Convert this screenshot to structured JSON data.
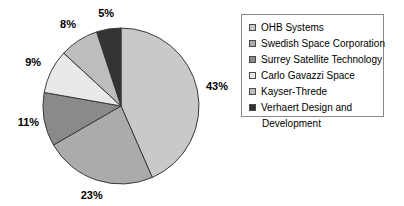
{
  "chart_data": {
    "type": "pie",
    "title": "",
    "xlabel": "",
    "ylabel": "",
    "legend_position": "right",
    "grid": false,
    "start_angle_deg": 0,
    "direction": "clockwise",
    "categories": [
      "OHB Systems",
      "Swedish Space Corporation",
      "Surrey Satellite Technology",
      "Carlo Gavazzi Space",
      "Kayser-Threde",
      "Verhaert Design and Development"
    ],
    "values": [
      43,
      23,
      11,
      9,
      8,
      5
    ],
    "labels": [
      "43%",
      "23%",
      "11%",
      "9%",
      "8%",
      "5%"
    ],
    "colors": [
      "#c9c9c9",
      "#ababab",
      "#8a8a8a",
      "#e9e9e9",
      "#bdbdbd",
      "#333333"
    ],
    "slice_edge_color": "#3a3a3a"
  },
  "pie": {
    "slices": [
      {
        "name": "OHB Systems",
        "value": 43,
        "label": "43%",
        "color": "#c9c9c9"
      },
      {
        "name": "Swedish Space Corporation",
        "value": 23,
        "label": "23%",
        "color": "#ababab"
      },
      {
        "name": "Surrey Satellite Technology",
        "value": 11,
        "label": "11%",
        "color": "#8a8a8a"
      },
      {
        "name": "Carlo Gavazzi Space",
        "value": 9,
        "label": "9%",
        "color": "#e9e9e9"
      },
      {
        "name": "Kayser-Threde",
        "value": 8,
        "label": "8%",
        "color": "#bdbdbd"
      },
      {
        "name": "Verhaert Design and Development",
        "value": 5,
        "label": "5%",
        "color": "#333333"
      }
    ]
  },
  "legend": {
    "entries": [
      {
        "label": "OHB Systems",
        "label_line2": "",
        "color": "#c9c9c9"
      },
      {
        "label": "Swedish Space Corporation",
        "label_line2": "",
        "color": "#ababab"
      },
      {
        "label": "Surrey Satellite Technology",
        "label_line2": "",
        "color": "#8a8a8a"
      },
      {
        "label": "Carlo Gavazzi Space",
        "label_line2": "",
        "color": "#e9e9e9"
      },
      {
        "label": "Kayser-Threde",
        "label_line2": "",
        "color": "#bdbdbd"
      },
      {
        "label": "Verhaert Design and",
        "label_line2": "Development",
        "color": "#333333"
      }
    ]
  }
}
